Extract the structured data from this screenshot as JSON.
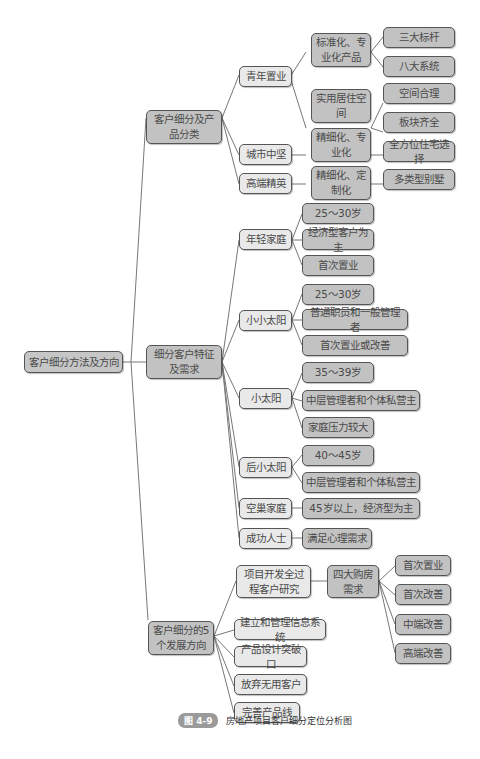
{
  "diagram": {
    "root": "客户细分方法及方向",
    "branches": [
      {
        "label": "客户细分及产品分类",
        "children": [
          {
            "label": "青年置业",
            "children": [
              {
                "label": "标准化、专业化产品",
                "children": [
                  "三大标杆",
                  "八大系统"
                ]
              },
              {
                "label": "实用居住空间",
                "children": [
                  "空间合理",
                  "板块齐全"
                ]
              }
            ]
          },
          {
            "label": "城市中坚",
            "children": [
              {
                "label": "精细化、专业化",
                "children": [
                  "全方位住宅选择"
                ]
              }
            ]
          },
          {
            "label": "高端精英",
            "children": [
              {
                "label": "精细化、定制化",
                "children": [
                  "多类型别墅"
                ]
              }
            ]
          }
        ]
      },
      {
        "label": "细分客户特征及需求",
        "children": [
          {
            "label": "年轻家庭",
            "children": [
              "25～30岁",
              "经济型客户为主",
              "首次置业"
            ]
          },
          {
            "label": "小小太阳",
            "children": [
              "25～30岁",
              "普通职员和一般管理者",
              "首次置业或改善"
            ]
          },
          {
            "label": "小太阳",
            "children": [
              "35～39岁",
              "中层管理者和个体私营主",
              "家庭压力较大"
            ]
          },
          {
            "label": "后小太阳",
            "children": [
              "40～45岁",
              "中层管理者和个体私营主"
            ]
          },
          {
            "label": "空巢家庭",
            "children": [
              "45岁以上，经济型为主"
            ]
          },
          {
            "label": "成功人士",
            "children": [
              "满足心理需求"
            ]
          }
        ]
      },
      {
        "label": "客户细分的5个发展方向",
        "children": [
          {
            "label": "项目开发全过程客户研究",
            "children": [
              {
                "label": "四大购房需求",
                "children": [
                  "首次置业",
                  "首次改善",
                  "中端改善",
                  "高端改善"
                ]
              }
            ]
          },
          {
            "label": "建立和管理信息系统",
            "children": []
          },
          {
            "label": "产品设计突破口",
            "children": []
          },
          {
            "label": "放弃无用客户",
            "children": []
          },
          {
            "label": "完善产品线",
            "children": []
          }
        ]
      }
    ]
  },
  "caption": {
    "figure_number": "图 4-9",
    "title": "房地产项目客户细分定位分析图"
  },
  "colors": {
    "light_node": "#e9e9e9",
    "dark_node": "#c2c2c2",
    "border": "#555555",
    "connector": "#777777"
  }
}
